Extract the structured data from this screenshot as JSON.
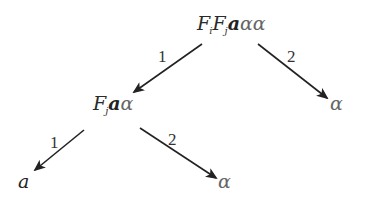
{
  "diagram": {
    "type": "tree",
    "arrow_color": "#222222",
    "text_color": "#222222",
    "alpha_color": "#666666",
    "nodes": {
      "root": {
        "F1": "F",
        "F1_sub": "i",
        "F2": "F",
        "F2_sub": "j",
        "a": "a",
        "alpha1": "α",
        "alpha2": "α"
      },
      "left": {
        "F": "F",
        "F_sub": "j",
        "a": "a",
        "alpha": "α"
      },
      "right": {
        "alpha": "α"
      },
      "left_left": {
        "a": "a"
      },
      "left_right": {
        "alpha": "α"
      }
    },
    "edges": [
      {
        "from": "root",
        "to": "left",
        "label": "1"
      },
      {
        "from": "root",
        "to": "right",
        "label": "2"
      },
      {
        "from": "left",
        "to": "left_left",
        "label": "1"
      },
      {
        "from": "left",
        "to": "left_right",
        "label": "2"
      }
    ]
  }
}
